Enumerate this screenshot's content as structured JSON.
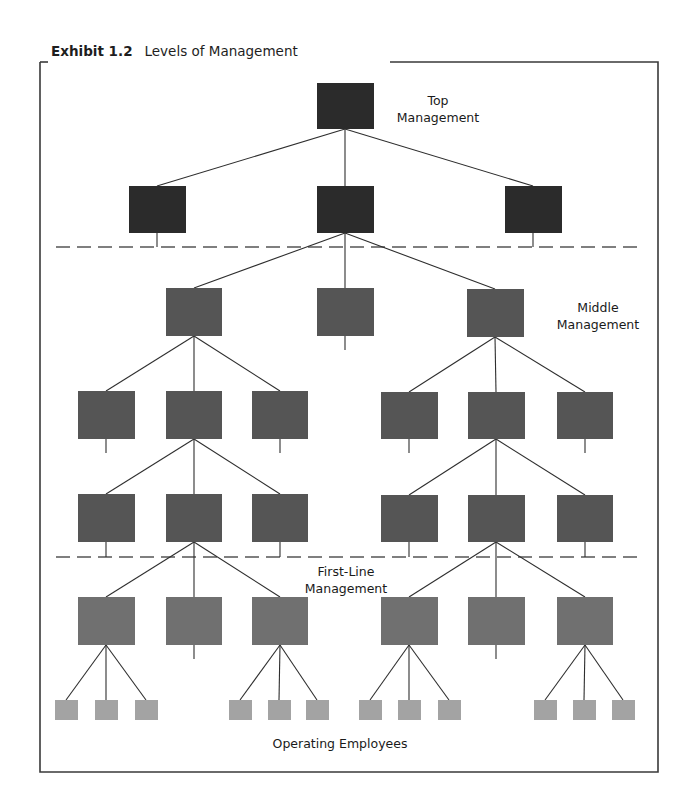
{
  "exhibit": {
    "number_label": "Exhibit 1.2",
    "title": "Levels of Management"
  },
  "labels": {
    "top_line1": "Top",
    "top_line2": "Management",
    "middle_line1": "Middle",
    "middle_line2": "Management",
    "first_line1": "First-Line",
    "first_line2": "Management",
    "operating": "Operating Employees"
  },
  "colors": {
    "top_box": "#2b2b2b",
    "middle_box": "#555555",
    "first_line_box": "#707070",
    "operating_box": "#a3a3a3",
    "line": "#2e2e2e"
  },
  "levels": [
    {
      "name": "top",
      "boxes": [
        [
          317,
          83,
          57,
          46
        ]
      ]
    },
    {
      "name": "top-second",
      "boxes": [
        [
          129,
          186,
          57,
          47
        ],
        [
          317,
          186,
          57,
          47
        ],
        [
          505,
          186,
          57,
          47
        ]
      ]
    },
    {
      "name": "middle-upper",
      "boxes": [
        [
          166,
          288,
          56,
          48
        ],
        [
          317,
          288,
          57,
          48
        ],
        [
          467,
          289,
          57,
          48
        ]
      ]
    },
    {
      "name": "middle-lower",
      "boxes": [
        [
          78,
          391,
          57,
          48
        ],
        [
          166,
          391,
          56,
          48
        ],
        [
          252,
          391,
          56,
          48
        ],
        [
          381,
          392,
          57,
          47
        ],
        [
          468,
          392,
          57,
          47
        ],
        [
          557,
          392,
          56,
          47
        ]
      ]
    },
    {
      "name": "middle-base",
      "boxes": [
        [
          78,
          494,
          57,
          48
        ],
        [
          166,
          494,
          56,
          48
        ],
        [
          252,
          494,
          56,
          48
        ],
        [
          381,
          495,
          57,
          47
        ],
        [
          468,
          495,
          57,
          47
        ],
        [
          557,
          495,
          56,
          47
        ]
      ]
    },
    {
      "name": "first-line",
      "boxes": [
        [
          78,
          597,
          57,
          48
        ],
        [
          166,
          597,
          56,
          48
        ],
        [
          252,
          597,
          56,
          48
        ],
        [
          381,
          597,
          57,
          48
        ],
        [
          468,
          597,
          57,
          48
        ],
        [
          557,
          597,
          56,
          48
        ]
      ]
    },
    {
      "name": "operating",
      "boxes": [
        [
          55,
          700,
          23,
          20
        ],
        [
          95,
          700,
          23,
          20
        ],
        [
          135,
          700,
          23,
          20
        ],
        [
          229,
          700,
          23,
          20
        ],
        [
          268,
          700,
          23,
          20
        ],
        [
          306,
          700,
          23,
          20
        ],
        [
          359,
          700,
          23,
          20
        ],
        [
          398,
          700,
          23,
          20
        ],
        [
          438,
          700,
          23,
          20
        ],
        [
          534,
          700,
          23,
          20
        ],
        [
          573,
          700,
          23,
          20
        ],
        [
          612,
          700,
          23,
          20
        ]
      ]
    }
  ]
}
